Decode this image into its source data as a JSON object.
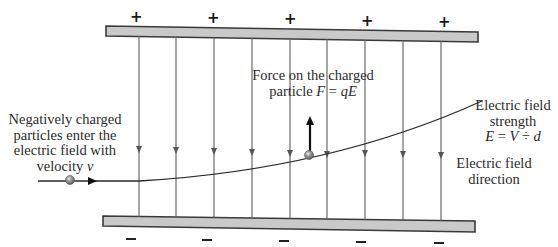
{
  "diagram": {
    "colors": {
      "plate_fill": "#c9c9c9",
      "plate_stroke": "#3a3a3a",
      "field_line": "#6a6a6a",
      "trajectory": "#2a2a2a",
      "particle": "#8a8a8a",
      "force_arrow": "#111111",
      "text": "#2b2b2b"
    },
    "top_plate": {
      "charge_label": "+",
      "signs": [
        {
          "x": 135,
          "y": 10
        },
        {
          "x": 212,
          "y": 11
        },
        {
          "x": 289,
          "y": 12
        },
        {
          "x": 366,
          "y": 14
        },
        {
          "x": 443,
          "y": 15
        }
      ],
      "corners": {
        "x1": 106,
        "y1_top": 26,
        "y1_bottom": 36,
        "x2": 478,
        "y2_top": 32,
        "y2_bottom": 42
      }
    },
    "bottom_plate": {
      "charge_label": "−",
      "signs": [
        {
          "x": 126,
          "y": 238
        },
        {
          "x": 202,
          "y": 239
        },
        {
          "x": 279,
          "y": 240
        },
        {
          "x": 356,
          "y": 241
        },
        {
          "x": 434,
          "y": 242
        }
      ],
      "corners": {
        "x1": 103,
        "y1_top": 216,
        "y1_bottom": 226,
        "x2": 475,
        "y2_top": 221,
        "y2_bottom": 232
      }
    },
    "field_lines": {
      "x_positions": [
        139,
        176,
        214,
        252,
        290,
        327,
        365,
        403,
        441
      ],
      "arrow_y": [
        151,
        152,
        153,
        154,
        155,
        156,
        155,
        156,
        157
      ]
    },
    "trajectory": {
      "entry_start": {
        "x": 38,
        "y": 181
      },
      "entry_particle": {
        "x": 70,
        "y": 180
      },
      "entry_arrow": {
        "x": 94,
        "y": 181
      },
      "curve_path": "M 38 181 L 139 181 Q 330 170 482 101",
      "deflected_particle": {
        "x": 309,
        "y": 155
      }
    },
    "force_arrow": {
      "x": 310,
      "y_start": 152,
      "y_end": 117
    },
    "labels": {
      "force": {
        "line1": "Force on the charged",
        "line2_prefix": "particle ",
        "line2_formula_F": "F",
        "line2_formula_eq": " = ",
        "line2_formula_q": "qE"
      },
      "entry": {
        "line1": "Negatively charged",
        "line2": "particles enter the",
        "line3": "electric field with",
        "line4_prefix": "velocity ",
        "line4_var": "v"
      },
      "field_strength": {
        "line1": "Electric field",
        "line2": "strength",
        "line3_E": "E",
        "line3_eq": " = ",
        "line3_V": "V",
        "line3_div": " ÷ ",
        "line3_d": "d"
      },
      "field_direction": {
        "line1": "Electric field",
        "line2": "direction"
      }
    }
  }
}
